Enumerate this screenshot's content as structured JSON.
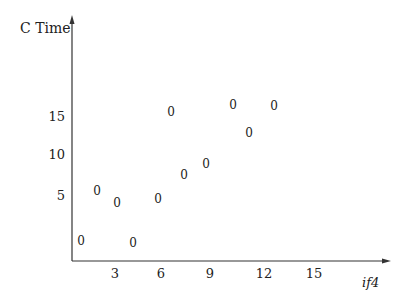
{
  "chart_data": {
    "type": "scatter",
    "title": "",
    "xlabel": "if4",
    "ylabel": "C Time",
    "marker_glyph": "0",
    "x_ticks": [
      "3",
      "6",
      "9",
      "12",
      "15"
    ],
    "y_ticks": [
      "15",
      "10",
      "5"
    ],
    "xlim": [
      0,
      19
    ],
    "ylim": [
      -2,
      20
    ],
    "grid": false,
    "legend": null,
    "series": [
      {
        "name": "points",
        "points": [
          {
            "x": 0.9,
            "y": -0.6
          },
          {
            "x": 1.9,
            "y": 5.7
          },
          {
            "x": 3.1,
            "y": 4.2
          },
          {
            "x": 4.1,
            "y": -0.9
          },
          {
            "x": 5.6,
            "y": 4.7
          },
          {
            "x": 6.4,
            "y": 15.7
          },
          {
            "x": 7.2,
            "y": 7.7
          },
          {
            "x": 8.5,
            "y": 9.1
          },
          {
            "x": 10.1,
            "y": 16.6
          },
          {
            "x": 11.1,
            "y": 13.0
          },
          {
            "x": 12.6,
            "y": 16.5
          }
        ]
      }
    ]
  },
  "axes": {
    "ylabel": "C Time",
    "xlabel": "if4",
    "y_ticks": [
      {
        "label": "15",
        "px_y": 117
      },
      {
        "label": "10",
        "px_y": 155
      },
      {
        "label": "5",
        "px_y": 196
      }
    ],
    "x_ticks": [
      {
        "label": "3",
        "px_x": 115
      },
      {
        "label": "6",
        "px_x": 161
      },
      {
        "label": "9",
        "px_x": 210
      },
      {
        "label": "12",
        "px_x": 264
      },
      {
        "label": "15",
        "px_x": 314
      }
    ],
    "markers": [
      {
        "glyph": "0",
        "px_x": 81,
        "px_y": 241
      },
      {
        "glyph": "0",
        "px_x": 97,
        "px_y": 191
      },
      {
        "glyph": "0",
        "px_x": 117,
        "px_y": 203
      },
      {
        "glyph": "0",
        "px_x": 133,
        "px_y": 243
      },
      {
        "glyph": "0",
        "px_x": 158,
        "px_y": 199
      },
      {
        "glyph": "0",
        "px_x": 171,
        "px_y": 112
      },
      {
        "glyph": "0",
        "px_x": 184,
        "px_y": 175
      },
      {
        "glyph": "0",
        "px_x": 206,
        "px_y": 164
      },
      {
        "glyph": "0",
        "px_x": 233,
        "px_y": 105
      },
      {
        "glyph": "0",
        "px_x": 249,
        "px_y": 133
      },
      {
        "glyph": "0",
        "px_x": 274,
        "px_y": 106
      }
    ],
    "colors": {
      "axis": "#333333",
      "text": "#222222"
    }
  }
}
